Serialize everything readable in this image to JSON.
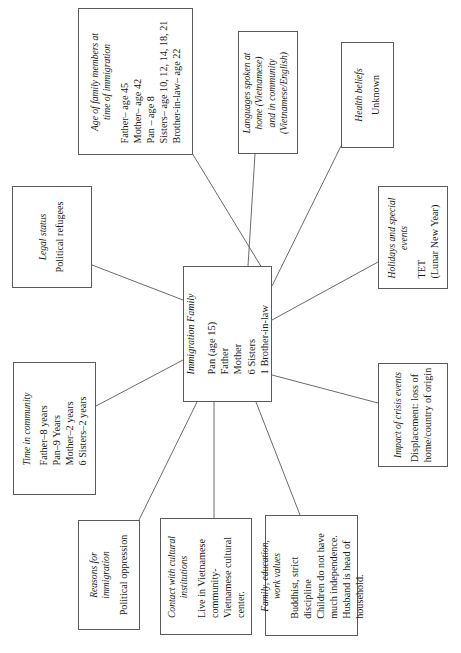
{
  "diagram": {
    "type": "concept-map",
    "orientation": "rotated-90-ccw",
    "background_color": "#ffffff",
    "line_color": "#5a5a5a",
    "text_color": "#1a1a1a"
  },
  "central": {
    "title_lines": [
      "Immigration Family"
    ],
    "body_lines": [
      "Pan (age 15)",
      "Father",
      "Mother",
      "6 Sisters",
      "1 Brother-in-law"
    ],
    "box": {
      "x": 183,
      "y": 266,
      "w": 89,
      "h": 136
    }
  },
  "nodes": [
    {
      "id": "age-of-family-members",
      "title_lines": [
        "Age of family members at",
        "time of immigration"
      ],
      "body_lines": [
        "Father– age 45",
        "Mother– age 42",
        "Pan – age 8",
        "Sisters– age 10, 12, 14, 18, 21",
        "Brother-in-law– age 22"
      ],
      "box": {
        "x": 78,
        "y": 8,
        "w": 115,
        "h": 147
      }
    },
    {
      "id": "languages-spoken",
      "title_lines": [
        "Languages spoken at",
        "home (Vietnamese)",
        "and in community",
        "(Vietnamese/English)"
      ],
      "body_lines": [],
      "box": {
        "x": 238,
        "y": 31,
        "w": 60,
        "h": 123
      }
    },
    {
      "id": "health-beliefs",
      "title_lines": [
        "Health beliefs"
      ],
      "body_lines": [
        "Unknown"
      ],
      "box": {
        "x": 341,
        "y": 42,
        "w": 53,
        "h": 106
      }
    },
    {
      "id": "legal-status",
      "title_lines": [
        "Legal status"
      ],
      "body_lines": [
        "Political refugees"
      ],
      "box": {
        "x": 12,
        "y": 186,
        "w": 80,
        "h": 102
      }
    },
    {
      "id": "holidays-and-special-events",
      "title_lines": [
        "Holidays and special",
        "events"
      ],
      "body_lines": [
        "TET",
        "(Lunar New Year)"
      ],
      "box": {
        "x": 378,
        "y": 186,
        "w": 70,
        "h": 103
      }
    },
    {
      "id": "time-in-community",
      "title_lines": [
        "Time in community"
      ],
      "body_lines": [
        "Father–8 years",
        "Pan–9 Years",
        "Mother–2 years",
        "6 Sisters–2 years"
      ],
      "box": {
        "x": 13,
        "y": 362,
        "w": 83,
        "h": 133
      }
    },
    {
      "id": "impact-of-crisis-events",
      "title_lines": [
        "Impact of crisis events"
      ],
      "body_lines": [
        "Displacement: loss of",
        "home/country of origin"
      ],
      "box": {
        "x": 378,
        "y": 363,
        "w": 70,
        "h": 104
      }
    },
    {
      "id": "reasons-for-immigration",
      "title_lines": [
        "Reasons for",
        "immigration"
      ],
      "body_lines": [
        "Political oppression"
      ],
      "box": {
        "x": 78,
        "y": 520,
        "w": 62,
        "h": 110
      }
    },
    {
      "id": "contact-with-cultural-institutions",
      "title_lines": [
        "Contact with cultural",
        "institutions"
      ],
      "body_lines": [
        "Live in Vietnamese",
        "community-",
        "Vietnamese cultural",
        "center."
      ],
      "box": {
        "x": 160,
        "y": 518,
        "w": 92,
        "h": 117
      }
    },
    {
      "id": "family-education-work-values",
      "title_lines": [
        "Family, education,",
        "work values"
      ],
      "body_lines": [
        "Buddhist, strict",
        "discipline",
        "Children do not have",
        "much independence.",
        "Husband is head of",
        "household."
      ],
      "box": {
        "x": 265,
        "y": 515,
        "w": 93,
        "h": 121
      }
    }
  ],
  "edges": [
    {
      "id": "edge-age-of-family-members",
      "from": "central",
      "to": "age-of-family-members",
      "x1": 262,
      "y1": 268,
      "x2": 192,
      "y2": 153
    },
    {
      "id": "edge-languages-spoken",
      "from": "central",
      "to": "languages-spoken",
      "x1": 248,
      "y1": 266,
      "x2": 255,
      "y2": 154
    },
    {
      "id": "edge-health-beliefs",
      "from": "central",
      "to": "health-beliefs",
      "x1": 272,
      "y1": 286,
      "x2": 341,
      "y2": 146
    },
    {
      "id": "edge-legal-status",
      "from": "central",
      "to": "legal-status",
      "x1": 183,
      "y1": 300,
      "x2": 92,
      "y2": 265
    },
    {
      "id": "edge-holidays",
      "from": "central",
      "to": "holidays",
      "x1": 272,
      "y1": 320,
      "x2": 378,
      "y2": 262
    },
    {
      "id": "edge-time-in-community",
      "from": "central",
      "to": "time-in-community",
      "x1": 183,
      "y1": 360,
      "x2": 96,
      "y2": 406
    },
    {
      "id": "edge-impact-of-crisis",
      "from": "central",
      "to": "impact-of-crisis",
      "x1": 272,
      "y1": 375,
      "x2": 378,
      "y2": 403
    },
    {
      "id": "edge-reasons-for-immigration",
      "from": "central",
      "to": "reasons-for-immigration",
      "x1": 197,
      "y1": 402,
      "x2": 139,
      "y2": 520
    },
    {
      "id": "edge-contact-cultural",
      "from": "central",
      "to": "contact-cultural",
      "x1": 214,
      "y1": 402,
      "x2": 214,
      "y2": 518
    },
    {
      "id": "edge-family-values",
      "from": "central",
      "to": "family-values",
      "x1": 256,
      "y1": 402,
      "x2": 300,
      "y2": 515
    }
  ]
}
